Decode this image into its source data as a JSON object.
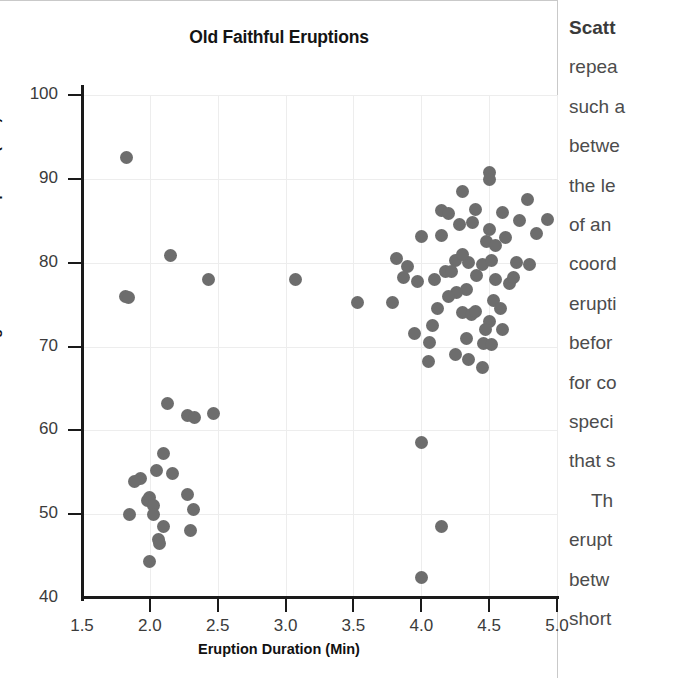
{
  "chart_data": {
    "type": "scatter",
    "title": "Old Faithful Eruptions",
    "xlabel": "Eruption Duration (Min)",
    "ylabel": "Waiting Time Between Eruptions (Min)",
    "xlim": [
      1.5,
      5.0
    ],
    "ylim": [
      40,
      100
    ],
    "xticks": [
      "1.5",
      "2.0",
      "2.5",
      "3.0",
      "3.5",
      "4.0",
      "4.5",
      "5.0"
    ],
    "xtick_values": [
      1.5,
      2.0,
      2.5,
      3.0,
      3.5,
      4.0,
      4.5,
      5.0
    ],
    "yticks": [
      "40",
      "50",
      "60",
      "70",
      "80",
      "90",
      "100"
    ],
    "ytick_values": [
      40,
      50,
      60,
      70,
      80,
      90,
      100
    ],
    "grid": true,
    "legend": null,
    "marker_color": "#6d6d6d",
    "points": [
      [
        1.83,
        92.6
      ],
      [
        1.82,
        76.0
      ],
      [
        1.84,
        75.8
      ],
      [
        2.15,
        80.8
      ],
      [
        2.43,
        78.0
      ],
      [
        3.07,
        78.0
      ],
      [
        3.53,
        75.2
      ],
      [
        2.13,
        63.2
      ],
      [
        2.28,
        61.8
      ],
      [
        2.33,
        61.5
      ],
      [
        2.47,
        62.0
      ],
      [
        2.1,
        57.2
      ],
      [
        2.05,
        55.2
      ],
      [
        1.93,
        54.2
      ],
      [
        1.89,
        53.9
      ],
      [
        2.17,
        54.8
      ],
      [
        2.0,
        52.0
      ],
      [
        1.98,
        51.6
      ],
      [
        2.03,
        51.0
      ],
      [
        2.28,
        52.3
      ],
      [
        2.32,
        50.5
      ],
      [
        1.85,
        50.0
      ],
      [
        2.03,
        50.0
      ],
      [
        2.1,
        48.5
      ],
      [
        2.06,
        47.0
      ],
      [
        2.07,
        46.5
      ],
      [
        2.3,
        48.0
      ],
      [
        2.0,
        44.3
      ],
      [
        3.82,
        80.5
      ],
      [
        3.87,
        78.2
      ],
      [
        3.79,
        75.3
      ],
      [
        4.0,
        83.1
      ],
      [
        3.97,
        77.8
      ],
      [
        3.95,
        71.5
      ],
      [
        4.05,
        68.2
      ],
      [
        4.0,
        58.5
      ],
      [
        4.15,
        48.5
      ],
      [
        4.0,
        42.5
      ],
      [
        4.15,
        86.2
      ],
      [
        4.2,
        85.9
      ],
      [
        4.3,
        88.5
      ],
      [
        4.25,
        80.2
      ],
      [
        4.18,
        79.0
      ],
      [
        4.22,
        79.0
      ],
      [
        4.35,
        80.0
      ],
      [
        4.33,
        76.8
      ],
      [
        4.26,
        76.5
      ],
      [
        4.3,
        74.0
      ],
      [
        4.37,
        73.8
      ],
      [
        4.41,
        78.5
      ],
      [
        4.45,
        79.8
      ],
      [
        4.48,
        82.5
      ],
      [
        4.5,
        90.8
      ],
      [
        4.5,
        89.9
      ],
      [
        4.5,
        84.0
      ],
      [
        4.52,
        80.3
      ],
      [
        4.55,
        78.0
      ],
      [
        4.53,
        75.5
      ],
      [
        4.5,
        73.0
      ],
      [
        4.47,
        72.0
      ],
      [
        4.46,
        70.4
      ],
      [
        4.52,
        70.2
      ],
      [
        4.6,
        86.0
      ],
      [
        4.62,
        83.0
      ],
      [
        4.65,
        77.5
      ],
      [
        4.68,
        78.2
      ],
      [
        4.7,
        80.0
      ],
      [
        4.72,
        85.0
      ],
      [
        4.78,
        87.5
      ],
      [
        4.8,
        79.8
      ],
      [
        4.85,
        83.5
      ],
      [
        4.93,
        85.2
      ],
      [
        4.1,
        78.0
      ],
      [
        4.12,
        74.5
      ],
      [
        4.08,
        72.5
      ],
      [
        4.06,
        70.5
      ],
      [
        4.38,
        84.8
      ],
      [
        4.4,
        86.3
      ],
      [
        4.28,
        84.5
      ],
      [
        4.15,
        83.2
      ],
      [
        3.9,
        79.5
      ],
      [
        4.33,
        71.0
      ],
      [
        4.4,
        74.2
      ],
      [
        4.58,
        74.5
      ],
      [
        4.6,
        72.0
      ],
      [
        4.25,
        69.0
      ],
      [
        4.35,
        68.5
      ],
      [
        4.45,
        67.5
      ],
      [
        4.55,
        82.0
      ],
      [
        4.3,
        81.0
      ],
      [
        4.2,
        76.0
      ]
    ]
  },
  "text_column": {
    "lines": [
      {
        "text": "Scatt",
        "bold": true,
        "indent": false
      },
      {
        "text": "repea",
        "bold": false,
        "indent": false
      },
      {
        "text": "such a",
        "bold": false,
        "indent": false
      },
      {
        "text": "betwe",
        "bold": false,
        "indent": false
      },
      {
        "text": "the le",
        "bold": false,
        "indent": false
      },
      {
        "text": "of an",
        "bold": false,
        "indent": false
      },
      {
        "text": "coord",
        "bold": false,
        "indent": false
      },
      {
        "text": "erupti",
        "bold": false,
        "indent": false
      },
      {
        "text": "befor",
        "bold": false,
        "indent": false
      },
      {
        "text": "for co",
        "bold": false,
        "indent": false
      },
      {
        "text": "speci",
        "bold": false,
        "indent": false
      },
      {
        "text": "that s",
        "bold": false,
        "indent": false
      },
      {
        "text": "Th",
        "bold": false,
        "indent": true
      },
      {
        "text": "erupt",
        "bold": false,
        "indent": false
      },
      {
        "text": "betw",
        "bold": false,
        "indent": false
      },
      {
        "text": "short",
        "bold": false,
        "indent": false
      }
    ]
  }
}
